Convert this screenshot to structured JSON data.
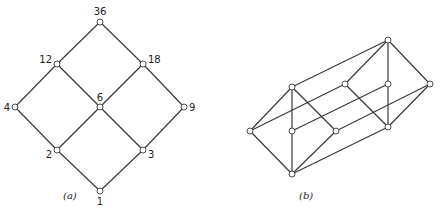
{
  "figure_a": {
    "caption": "(a)",
    "nodes": [
      {
        "id": "36",
        "label": "36",
        "x": 100,
        "y": 22,
        "lx": 100,
        "ly": 15,
        "anchor": "middle"
      },
      {
        "id": "12",
        "label": "12",
        "x": 57,
        "y": 64,
        "lx": 52,
        "ly": 63,
        "anchor": "end"
      },
      {
        "id": "18",
        "label": "18",
        "x": 143,
        "y": 64,
        "lx": 148,
        "ly": 63,
        "anchor": "start"
      },
      {
        "id": "4",
        "label": "4",
        "x": 15,
        "y": 107,
        "lx": 10,
        "ly": 111,
        "anchor": "end"
      },
      {
        "id": "6",
        "label": "6",
        "x": 100,
        "y": 107,
        "lx": 100,
        "ly": 101,
        "anchor": "middle"
      },
      {
        "id": "9",
        "label": "9",
        "x": 184,
        "y": 107,
        "lx": 189,
        "ly": 111,
        "anchor": "start"
      },
      {
        "id": "2",
        "label": "2",
        "x": 57,
        "y": 150,
        "lx": 52,
        "ly": 158,
        "anchor": "end"
      },
      {
        "id": "3",
        "label": "3",
        "x": 143,
        "y": 150,
        "lx": 148,
        "ly": 158,
        "anchor": "start"
      },
      {
        "id": "1",
        "label": "1",
        "x": 100,
        "y": 191,
        "lx": 100,
        "ly": 205,
        "anchor": "middle"
      }
    ],
    "edges": [
      [
        "36",
        "12"
      ],
      [
        "36",
        "18"
      ],
      [
        "12",
        "4"
      ],
      [
        "12",
        "6"
      ],
      [
        "18",
        "6"
      ],
      [
        "18",
        "9"
      ],
      [
        "4",
        "2"
      ],
      [
        "6",
        "2"
      ],
      [
        "6",
        "3"
      ],
      [
        "9",
        "3"
      ],
      [
        "2",
        "1"
      ],
      [
        "3",
        "1"
      ]
    ],
    "caption_pos": {
      "x": 63,
      "y": 199
    }
  },
  "figure_b": {
    "caption": "(b)",
    "nodes": [
      {
        "id": "T1",
        "x": 292,
        "y": 87
      },
      {
        "id": "L1",
        "x": 250,
        "y": 131
      },
      {
        "id": "C1",
        "x": 292,
        "y": 131
      },
      {
        "id": "R1",
        "x": 336,
        "y": 131
      },
      {
        "id": "B1",
        "x": 292,
        "y": 174
      },
      {
        "id": "T2",
        "x": 388,
        "y": 40
      },
      {
        "id": "L2",
        "x": 345,
        "y": 84
      },
      {
        "id": "C2",
        "x": 388,
        "y": 84
      },
      {
        "id": "R2",
        "x": 430,
        "y": 84
      },
      {
        "id": "B2",
        "x": 388,
        "y": 127
      }
    ],
    "edges": [
      [
        "T1",
        "L1"
      ],
      [
        "T1",
        "C1"
      ],
      [
        "T1",
        "R1"
      ],
      [
        "L1",
        "B1"
      ],
      [
        "C1",
        "B1"
      ],
      [
        "R1",
        "B1"
      ],
      [
        "T2",
        "L2"
      ],
      [
        "T2",
        "C2"
      ],
      [
        "T2",
        "R2"
      ],
      [
        "L2",
        "B2"
      ],
      [
        "C2",
        "B2"
      ],
      [
        "R2",
        "B2"
      ],
      [
        "T1",
        "T2"
      ],
      [
        "L1",
        "L2"
      ],
      [
        "C1",
        "C2"
      ],
      [
        "R1",
        "R2"
      ],
      [
        "B1",
        "B2"
      ]
    ],
    "caption_pos": {
      "x": 299,
      "y": 199
    }
  }
}
